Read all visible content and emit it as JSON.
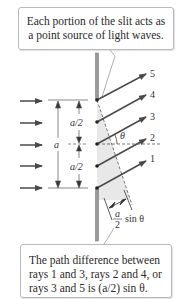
{
  "callouts": {
    "top": {
      "lines": [
        "Each portion of the slit acts as",
        "a point source of light waves."
      ]
    },
    "bottom": {
      "lines": [
        "The path difference between",
        "rays 1 and 3, rays 2 and 4, or",
        "rays 3 and 5 is (a/2) sin θ."
      ]
    }
  },
  "diagram": {
    "ray_labels": [
      "1",
      "2",
      "3",
      "4",
      "5"
    ],
    "slit_width_label": "a",
    "half_width_label_upper": "a/2",
    "half_width_label_lower": "a/2",
    "angle_label": "θ",
    "path_diff_numerator": "a",
    "path_diff_denominator": "2",
    "path_diff_suffix": "sin θ",
    "colors": {
      "ray": "#4a4a4a",
      "wall": "#8a8a8a",
      "shade": "#e6e6e6",
      "text": "#2a2a2a"
    }
  }
}
